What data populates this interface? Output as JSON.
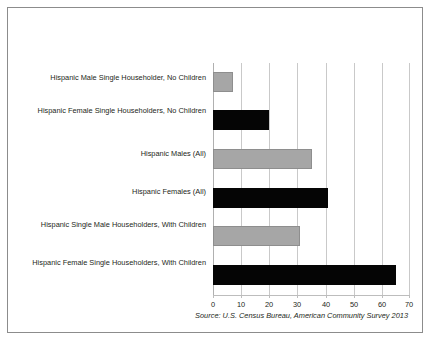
{
  "chart_data": {
    "type": "bar",
    "orientation": "horizontal",
    "title": "",
    "xlabel": "",
    "ylabel": "",
    "xlim": [
      0,
      70
    ],
    "xticks": [
      0,
      10,
      20,
      30,
      40,
      50,
      60,
      70
    ],
    "grid": true,
    "legend": null,
    "categories": [
      "Hispanic Male Single Householder, No Children",
      "Hispanic Female Single Householders, No Children",
      "Hispanic Males (All)",
      "Hispanic Females (All)",
      "Hispanic Single Male Householders, With Children",
      "Hispanic Female Single Householders, With Children"
    ],
    "values": [
      7,
      20,
      35,
      41,
      31,
      65
    ],
    "bar_colors": [
      "#a6a6a6",
      "#000000",
      "#a6a6a6",
      "#000000",
      "#a6a6a6",
      "#000000"
    ],
    "annotation": "Source: U.S. Census Bureau, American Community Survey 2013"
  },
  "colors": {
    "gray_bar": "#a6a6a6",
    "black_bar": "#000000",
    "gridline": "#c9c9c9",
    "border": "#8c8c8c",
    "text": "#231f20"
  }
}
